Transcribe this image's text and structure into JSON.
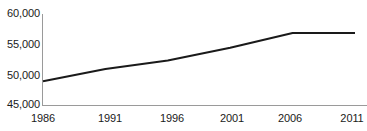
{
  "chart_data": {
    "type": "line",
    "title": "",
    "subtitle": "",
    "xlabel": "",
    "ylabel": "",
    "x": [
      1986,
      1991,
      1996,
      2001,
      2006,
      2011
    ],
    "categories": [
      "1986",
      "1991",
      "1996",
      "2001",
      "2006",
      "2011"
    ],
    "values": [
      48900,
      50900,
      52300,
      54400,
      56800,
      56800
    ],
    "series": [
      {
        "name": "",
        "values": [
          48900,
          50900,
          52300,
          54400,
          56800,
          56800
        ],
        "color": "#1a1a1a"
      }
    ],
    "xlim": [
      1986,
      2011
    ],
    "ylim": [
      45000,
      60000
    ],
    "ytick_labels": [
      "60,000",
      "55,000",
      "50,000",
      "45,000"
    ],
    "ytick_values": [
      60000,
      55000,
      50000,
      45000
    ],
    "xtick_labels": [
      "1986",
      "1991",
      "1996",
      "2001",
      "2006",
      "2011"
    ],
    "grid": false,
    "legend": false,
    "legend_position": "none",
    "annotations": [],
    "axis_color": "#9a9a9a",
    "line_color": "#1a1a1a",
    "background_color": "#ffffff",
    "text_color": "#1a1a1a"
  }
}
